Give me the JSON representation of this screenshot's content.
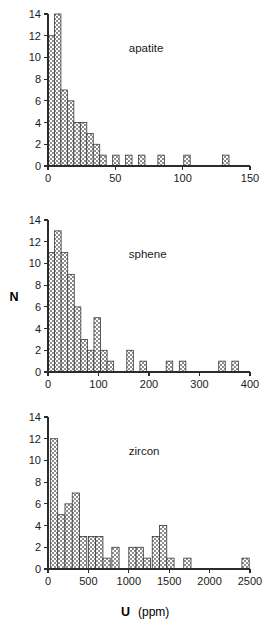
{
  "figure": {
    "background": "#ffffff",
    "bar_fill_color": "#9a9a9a",
    "bar_edge_color": "#3a3a3a",
    "axis_color": "#2b2b2b",
    "y_axis_title": "N",
    "x_axis_title_main": "U",
    "x_axis_title_units": "(ppm)"
  },
  "chart_data": [
    {
      "type": "bar",
      "title": "apatite",
      "xlabel": "U (ppm)",
      "ylabel": "N",
      "xlim": [
        0,
        150
      ],
      "ylim": [
        0,
        14
      ],
      "xticks": [
        0,
        50,
        100,
        150
      ],
      "xtick_labels": [
        "0",
        "50",
        "100",
        "150"
      ],
      "yticks": [
        0,
        2,
        4,
        6,
        8,
        10,
        12,
        14
      ],
      "ytick_labels": [
        "0",
        "2",
        "4",
        "6",
        "8",
        "10",
        "12",
        "14"
      ],
      "bin_width": 4.8,
      "grid": false,
      "legend": "none",
      "bins": [
        {
          "x0": 0.0,
          "x1": 4.8,
          "value": 12
        },
        {
          "x0": 4.8,
          "x1": 9.6,
          "value": 14
        },
        {
          "x0": 9.6,
          "x1": 14.4,
          "value": 7
        },
        {
          "x0": 14.4,
          "x1": 19.2,
          "value": 6
        },
        {
          "x0": 19.2,
          "x1": 24.0,
          "value": 4
        },
        {
          "x0": 24.0,
          "x1": 28.8,
          "value": 4
        },
        {
          "x0": 28.8,
          "x1": 33.6,
          "value": 3
        },
        {
          "x0": 33.6,
          "x1": 38.4,
          "value": 2
        },
        {
          "x0": 38.4,
          "x1": 43.2,
          "value": 1
        },
        {
          "x0": 48.0,
          "x1": 52.8,
          "value": 1
        },
        {
          "x0": 57.6,
          "x1": 62.4,
          "value": 1
        },
        {
          "x0": 67.2,
          "x1": 72.0,
          "value": 1
        },
        {
          "x0": 81.6,
          "x1": 86.4,
          "value": 1
        },
        {
          "x0": 100.8,
          "x1": 105.6,
          "value": 1
        },
        {
          "x0": 129.6,
          "x1": 134.4,
          "value": 1
        }
      ]
    },
    {
      "type": "bar",
      "title": "sphene",
      "xlabel": "U (ppm)",
      "ylabel": "N",
      "xlim": [
        0,
        400
      ],
      "ylim": [
        0,
        14
      ],
      "xticks": [
        0,
        100,
        200,
        300,
        400
      ],
      "xtick_labels": [
        "0",
        "100",
        "200",
        "300",
        "400"
      ],
      "yticks": [
        0,
        2,
        4,
        6,
        8,
        10,
        12,
        14
      ],
      "ytick_labels": [
        "0",
        "2",
        "4",
        "6",
        "8",
        "10",
        "12",
        "14"
      ],
      "bin_width": 13.0,
      "grid": false,
      "legend": "none",
      "bins": [
        {
          "x0": 0,
          "x1": 13,
          "value": 11
        },
        {
          "x0": 13,
          "x1": 26,
          "value": 13
        },
        {
          "x0": 26,
          "x1": 39,
          "value": 11
        },
        {
          "x0": 39,
          "x1": 52,
          "value": 9
        },
        {
          "x0": 52,
          "x1": 65,
          "value": 6
        },
        {
          "x0": 65,
          "x1": 78,
          "value": 3
        },
        {
          "x0": 78,
          "x1": 91,
          "value": 2
        },
        {
          "x0": 91,
          "x1": 104,
          "value": 5
        },
        {
          "x0": 104,
          "x1": 117,
          "value": 2
        },
        {
          "x0": 117,
          "x1": 130,
          "value": 1
        },
        {
          "x0": 156,
          "x1": 169,
          "value": 2
        },
        {
          "x0": 182,
          "x1": 195,
          "value": 1
        },
        {
          "x0": 234,
          "x1": 247,
          "value": 1
        },
        {
          "x0": 260,
          "x1": 273,
          "value": 1
        },
        {
          "x0": 338,
          "x1": 351,
          "value": 1
        },
        {
          "x0": 364,
          "x1": 377,
          "value": 1
        }
      ]
    },
    {
      "type": "bar",
      "title": "zircon",
      "xlabel": "U (ppm)",
      "ylabel": "N",
      "xlim": [
        0,
        2500
      ],
      "ylim": [
        0,
        14
      ],
      "xticks": [
        0,
        500,
        1000,
        1500,
        2000,
        2500
      ],
      "xtick_labels": [
        "0",
        "500",
        "1000",
        "1500",
        "2000",
        "2500"
      ],
      "yticks": [
        0,
        2,
        4,
        6,
        8,
        10,
        12,
        14
      ],
      "ytick_labels": [
        "0",
        "2",
        "4",
        "6",
        "8",
        "10",
        "12",
        "14"
      ],
      "bin_width": 90,
      "grid": false,
      "legend": "none",
      "bins": [
        {
          "x0": 30,
          "x1": 120,
          "value": 12
        },
        {
          "x0": 120,
          "x1": 210,
          "value": 5
        },
        {
          "x0": 210,
          "x1": 300,
          "value": 6
        },
        {
          "x0": 300,
          "x1": 390,
          "value": 7
        },
        {
          "x0": 390,
          "x1": 480,
          "value": 3
        },
        {
          "x0": 500,
          "x1": 590,
          "value": 3
        },
        {
          "x0": 590,
          "x1": 680,
          "value": 3
        },
        {
          "x0": 680,
          "x1": 770,
          "value": 1
        },
        {
          "x0": 790,
          "x1": 880,
          "value": 2
        },
        {
          "x0": 1000,
          "x1": 1090,
          "value": 2
        },
        {
          "x0": 1090,
          "x1": 1180,
          "value": 2
        },
        {
          "x0": 1180,
          "x1": 1270,
          "value": 1
        },
        {
          "x0": 1290,
          "x1": 1380,
          "value": 3
        },
        {
          "x0": 1380,
          "x1": 1470,
          "value": 4
        },
        {
          "x0": 1470,
          "x1": 1560,
          "value": 1
        },
        {
          "x0": 1680,
          "x1": 1770,
          "value": 1
        },
        {
          "x0": 2400,
          "x1": 2490,
          "value": 1
        }
      ]
    }
  ]
}
